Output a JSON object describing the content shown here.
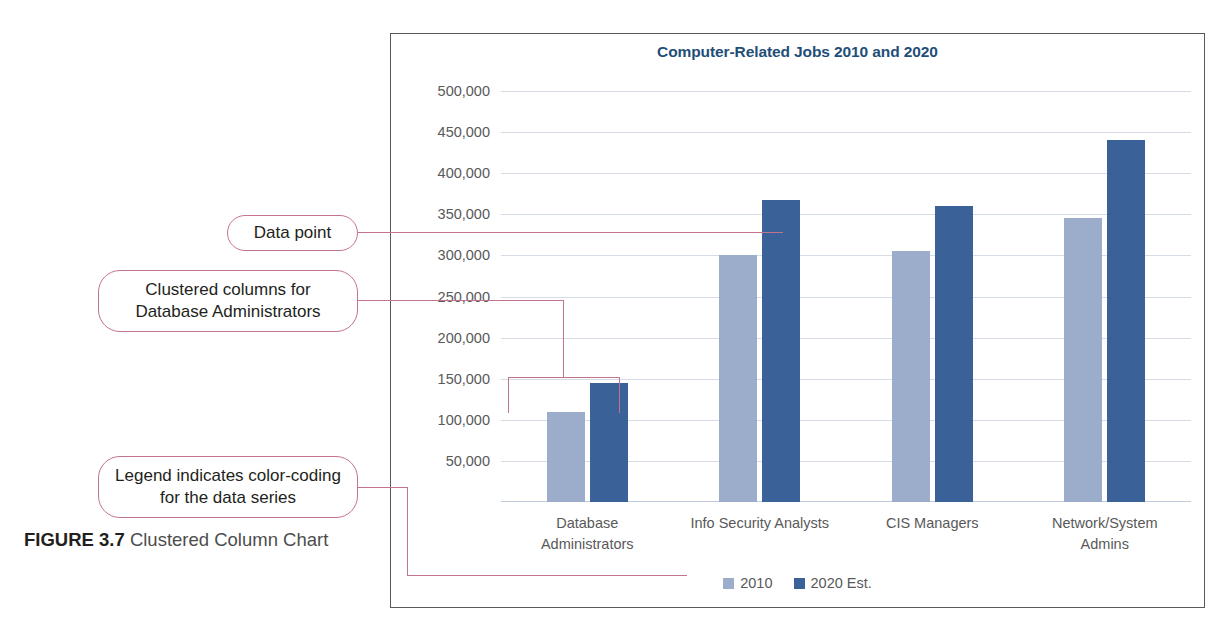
{
  "figure": {
    "number_label": "FIGURE 3.7",
    "caption": "Clustered Column Chart"
  },
  "chart": {
    "title": "Computer-Related Jobs 2010 and 2020",
    "title_color": "#1f4e79",
    "border_color": "#595959",
    "gridline_color": "#d6dce5"
  },
  "callouts": [
    {
      "id": "data-point",
      "text": "Data point"
    },
    {
      "id": "clustered-columns",
      "text": "Clustered columns for Database Administrators"
    },
    {
      "id": "legend-note",
      "text": "Legend indicates color-coding for the data series"
    }
  ],
  "legend": {
    "entries": [
      {
        "label": "2010",
        "color": "#9badcb"
      },
      {
        "label": "2020 Est.",
        "color": "#3a6298"
      }
    ]
  },
  "chart_data": {
    "type": "bar",
    "title": "Computer-Related Jobs 2010 and 2020",
    "xlabel": "",
    "ylabel": "",
    "ylim": [
      0,
      500000
    ],
    "grid": true,
    "legend_position": "bottom",
    "ytick_labels": [
      "500,000",
      "450,000",
      "400,000",
      "350,000",
      "300,000",
      "250,000",
      "200,000",
      "150,000",
      "100,000",
      "50,000"
    ],
    "ytick_values": [
      500000,
      450000,
      400000,
      350000,
      300000,
      250000,
      200000,
      150000,
      100000,
      50000
    ],
    "categories": [
      "Database Administrators",
      "Info Security Analysts",
      "CIS Managers",
      "Network/System Admins"
    ],
    "category_lines": [
      [
        "Database",
        "Administrators"
      ],
      [
        "Info Security Analysts"
      ],
      [
        "CIS Managers"
      ],
      [
        "Network/System",
        "Admins"
      ]
    ],
    "series": [
      {
        "name": "2010",
        "color": "#9badcb",
        "values": [
          110000,
          300000,
          305000,
          345000
        ]
      },
      {
        "name": "2020 Est.",
        "color": "#3a6298",
        "values": [
          145000,
          368000,
          360000,
          440000
        ]
      }
    ]
  }
}
